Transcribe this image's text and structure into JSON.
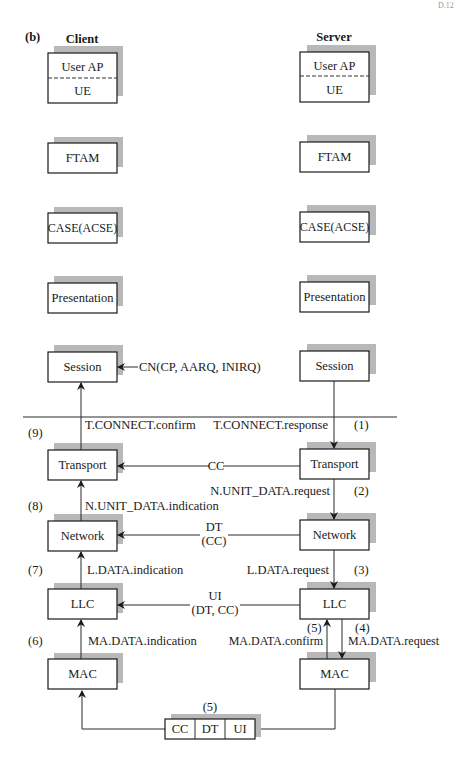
{
  "figure": {
    "part_label": "(b)",
    "corner_mark": "D.12"
  },
  "client": {
    "heading": "Client",
    "layers": {
      "user_ap": "User AP",
      "ue": "UE",
      "ftam": "FTAM",
      "case": "CASE(ACSE)",
      "presentation": "Presentation",
      "session": "Session",
      "transport": "Transport",
      "network": "Network",
      "llc": "LLC",
      "mac": "MAC"
    }
  },
  "server": {
    "heading": "Server",
    "layers": {
      "user_ap": "User AP",
      "ue": "UE",
      "ftam": "FTAM",
      "case": "CASE(ACSE)",
      "presentation": "Presentation",
      "session": "Session",
      "transport": "Transport",
      "network": "Network",
      "llc": "LLC",
      "mac": "MAC"
    }
  },
  "messages": {
    "session_pdu": "CN(CP, AARQ, INIRQ)",
    "t_connect_confirm": "T.CONNECT.confirm",
    "t_connect_response": "T.CONNECT.response",
    "cc": "CC",
    "n_unit_data_request": "N.UNIT_DATA.request",
    "n_unit_data_indication": "N.UNIT_DATA.indication",
    "dt": "DT",
    "dt_sub": "(CC)",
    "l_data_indication": "L.DATA.indication",
    "l_data_request": "L.DATA.request",
    "ui": "UI",
    "ui_sub": "(DT, CC)",
    "ma_data_indication": "MA.DATA.indication",
    "ma_data_confirm": "MA.DATA.confirm",
    "ma_data_request": "MA.DATA.request"
  },
  "steps": {
    "s1": "(1)",
    "s2": "(2)",
    "s3": "(3)",
    "s4": "(4)",
    "s5_confirm": "(5)",
    "s5_frame": "(5)",
    "s6": "(6)",
    "s7": "(7)",
    "s8": "(8)",
    "s9": "(9)"
  },
  "frame": {
    "fields": [
      "CC",
      "DT",
      "UI"
    ]
  }
}
